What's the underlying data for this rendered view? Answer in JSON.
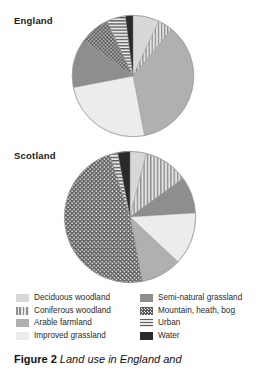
{
  "caption": {
    "figure_number": "Figure 2",
    "text": "Land use in England and"
  },
  "regions": [
    {
      "key": "england",
      "label": "England"
    },
    {
      "key": "scotland",
      "label": "Scotland"
    }
  ],
  "legend": {
    "left_column": [
      {
        "key": "deciduous",
        "label": "Deciduous woodland",
        "color": "#d8d8d8",
        "pattern": "solid"
      },
      {
        "key": "coniferous",
        "label": "Coniferous woodland",
        "color": "#bdbdbd",
        "pattern": "vertical-lines"
      },
      {
        "key": "arable",
        "label": "Arable farmland",
        "color": "#b0b0b0",
        "pattern": "solid"
      },
      {
        "key": "improved",
        "label": "Improved grassland",
        "color": "#ececec",
        "pattern": "solid"
      }
    ],
    "right_column": [
      {
        "key": "seminatural",
        "label": "Semi-natural grassland",
        "color": "#8e8e8e",
        "pattern": "solid"
      },
      {
        "key": "mountain",
        "label": "Mountain, heath, bog",
        "color": "#6b6b6b",
        "pattern": "checker-dots"
      },
      {
        "key": "urban",
        "label": "Urban",
        "color": "#9a9a9a",
        "pattern": "horizontal-lines"
      },
      {
        "key": "water",
        "label": "Water",
        "color": "#2a2a2a",
        "pattern": "solid"
      }
    ]
  },
  "chart_data": {
    "type": "pie",
    "legend_position": "bottom",
    "categories": [
      "Deciduous woodland",
      "Coniferous woodland",
      "Arable farmland",
      "Improved grassland",
      "Semi-natural grassland",
      "Mountain, heath, bog",
      "Urban",
      "Water"
    ],
    "colors": [
      "#d8d8d8",
      "#bdbdbd",
      "#b0b0b0",
      "#ececec",
      "#8e8e8e",
      "#6b6b6b",
      "#9a9a9a",
      "#2a2a2a"
    ],
    "patterns": [
      "solid",
      "vertical-lines",
      "solid",
      "solid",
      "solid",
      "checker-dots",
      "horizontal-lines",
      "solid"
    ],
    "series": [
      {
        "name": "England",
        "values": [
          7,
          4,
          36,
          25,
          13,
          8,
          5,
          2
        ],
        "unit": "percent"
      },
      {
        "name": "Scotland",
        "values": [
          4,
          11,
          10,
          13,
          9,
          48,
          2,
          3
        ],
        "unit": "percent"
      }
    ]
  }
}
